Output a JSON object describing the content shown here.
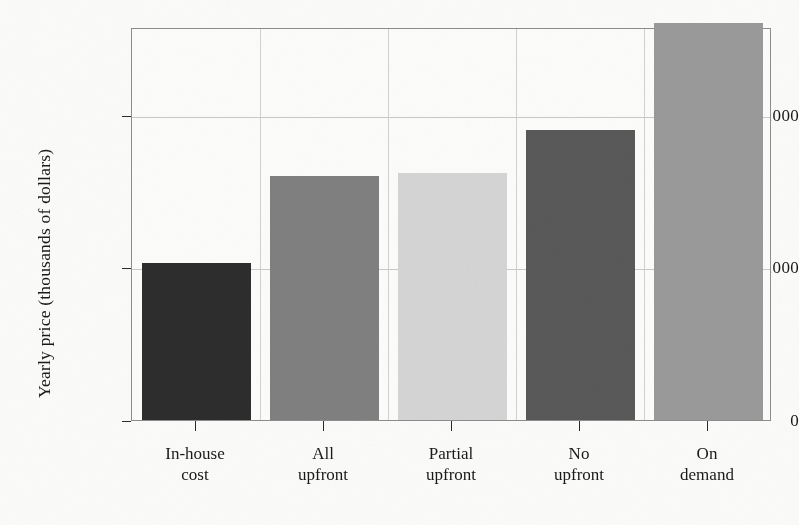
{
  "chart_data": {
    "type": "bar",
    "title": "",
    "xlabel": "",
    "ylabel": "Yearly price (thousands of dollars)",
    "categories": [
      "In-house\ncost",
      "All\nupfront",
      "Partial\nupfront",
      "No\nupfront",
      "On\ndemand"
    ],
    "categories_flat": [
      "In-house cost",
      "All upfront",
      "Partial upfront",
      "No upfront",
      "On demand"
    ],
    "values": [
      1030,
      1600,
      1620,
      1900,
      2600
    ],
    "bar_colors": [
      "#2d2d2d",
      "#808080",
      "#d5d5d5",
      "#595959",
      "#9a9a9a"
    ],
    "ylim": [
      0,
      2575
    ],
    "yticks": [
      0,
      1000,
      2000
    ],
    "ytick_labels": [
      "0",
      "1,000",
      "2,000"
    ],
    "grid": "both",
    "legend": "none"
  },
  "axis": {
    "frame_color": "#8d8d8d",
    "gridline_color": "#c9c9c9",
    "tick_color": "#2a2a2a"
  }
}
